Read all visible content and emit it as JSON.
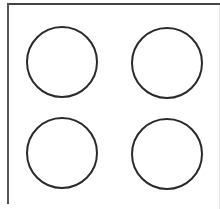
{
  "diagram": {
    "background": "#ffffff",
    "stroke_color": "#2a2a2a",
    "frame": {
      "top_line": {
        "x1": 7,
        "y1": 4,
        "x2": 220,
        "y2": 4
      },
      "left_line": {
        "x1": 8,
        "y1": 3,
        "x2": 8,
        "y2": 204
      }
    },
    "shapes": [
      {
        "type": "circle",
        "position": "top-left",
        "cx": 62,
        "cy": 62,
        "r": 36
      },
      {
        "type": "circle",
        "position": "top-right",
        "cx": 167,
        "cy": 63,
        "r": 36
      },
      {
        "type": "circle",
        "position": "bottom-left",
        "cx": 62,
        "cy": 153,
        "r": 36
      },
      {
        "type": "circle",
        "position": "bottom-right",
        "cx": 167,
        "cy": 154,
        "r": 36
      }
    ],
    "grid": {
      "rows": 2,
      "cols": 2
    }
  }
}
